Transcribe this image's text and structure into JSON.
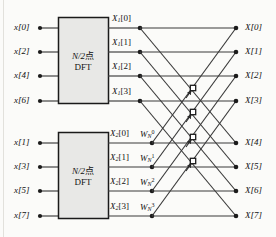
{
  "figure": {
    "type": "signal-flow-graph",
    "background_color": "#fbfbf9",
    "line_color": "#3a3a3a",
    "box_fill": "#e8e8e6",
    "box_stroke": "#1a1a1a"
  },
  "inputs": [
    {
      "label": "x[0]",
      "row": 0
    },
    {
      "label": "x[2]",
      "row": 1
    },
    {
      "label": "x[4]",
      "row": 2
    },
    {
      "label": "x[6]",
      "row": 3
    },
    {
      "label": "x[1]",
      "row": 4
    },
    {
      "label": "x[3]",
      "row": 5
    },
    {
      "label": "x[5]",
      "row": 6
    },
    {
      "label": "x[7]",
      "row": 7
    }
  ],
  "blocks": [
    {
      "id": "dft-top",
      "line1": "N/2点",
      "line2": "DFT",
      "n_text": "N/2",
      "unit_text": "点"
    },
    {
      "id": "dft-bottom",
      "line1": "N/2点",
      "line2": "DFT",
      "n_text": "N/2",
      "unit_text": "点"
    }
  ],
  "intermediate_top": [
    {
      "base": "X",
      "sub": "1",
      "index": "[0]",
      "row": 0
    },
    {
      "base": "X",
      "sub": "1",
      "index": "[1]",
      "row": 1
    },
    {
      "base": "X",
      "sub": "1",
      "index": "[2]",
      "row": 2
    },
    {
      "base": "X",
      "sub": "1",
      "index": "[3]",
      "row": 3
    }
  ],
  "intermediate_bottom": [
    {
      "base": "X",
      "sub": "2",
      "index": "[0]",
      "row": 4
    },
    {
      "base": "X",
      "sub": "2",
      "index": "[1]",
      "row": 5
    },
    {
      "base": "X",
      "sub": "2",
      "index": "[2]",
      "row": 6
    },
    {
      "base": "X",
      "sub": "2",
      "index": "[3]",
      "row": 7
    }
  ],
  "twiddle_factors": [
    {
      "base": "W",
      "sub": "N",
      "sup": "0",
      "row": 4
    },
    {
      "base": "W",
      "sub": "N",
      "sup": "1",
      "row": 5
    },
    {
      "base": "W",
      "sub": "N",
      "sup": "2",
      "row": 6
    },
    {
      "base": "W",
      "sub": "N",
      "sup": "3",
      "row": 7
    }
  ],
  "outputs": [
    {
      "label": "X[0]",
      "row": 0
    },
    {
      "label": "X[1]",
      "row": 1
    },
    {
      "label": "X[2]",
      "row": 2
    },
    {
      "label": "X[3]",
      "row": 3
    },
    {
      "label": "X[4]",
      "row": 4
    },
    {
      "label": "X[5]",
      "row": 5
    },
    {
      "label": "X[6]",
      "row": 6
    },
    {
      "label": "X[7]",
      "row": 7
    }
  ],
  "merge_nodes": [
    {
      "id": "merge-0",
      "x": 193,
      "y": 88
    },
    {
      "id": "merge-1",
      "x": 193,
      "y": 112
    },
    {
      "id": "merge-2",
      "x": 193,
      "y": 137
    },
    {
      "id": "merge-3",
      "x": 193,
      "y": 161
    }
  ]
}
